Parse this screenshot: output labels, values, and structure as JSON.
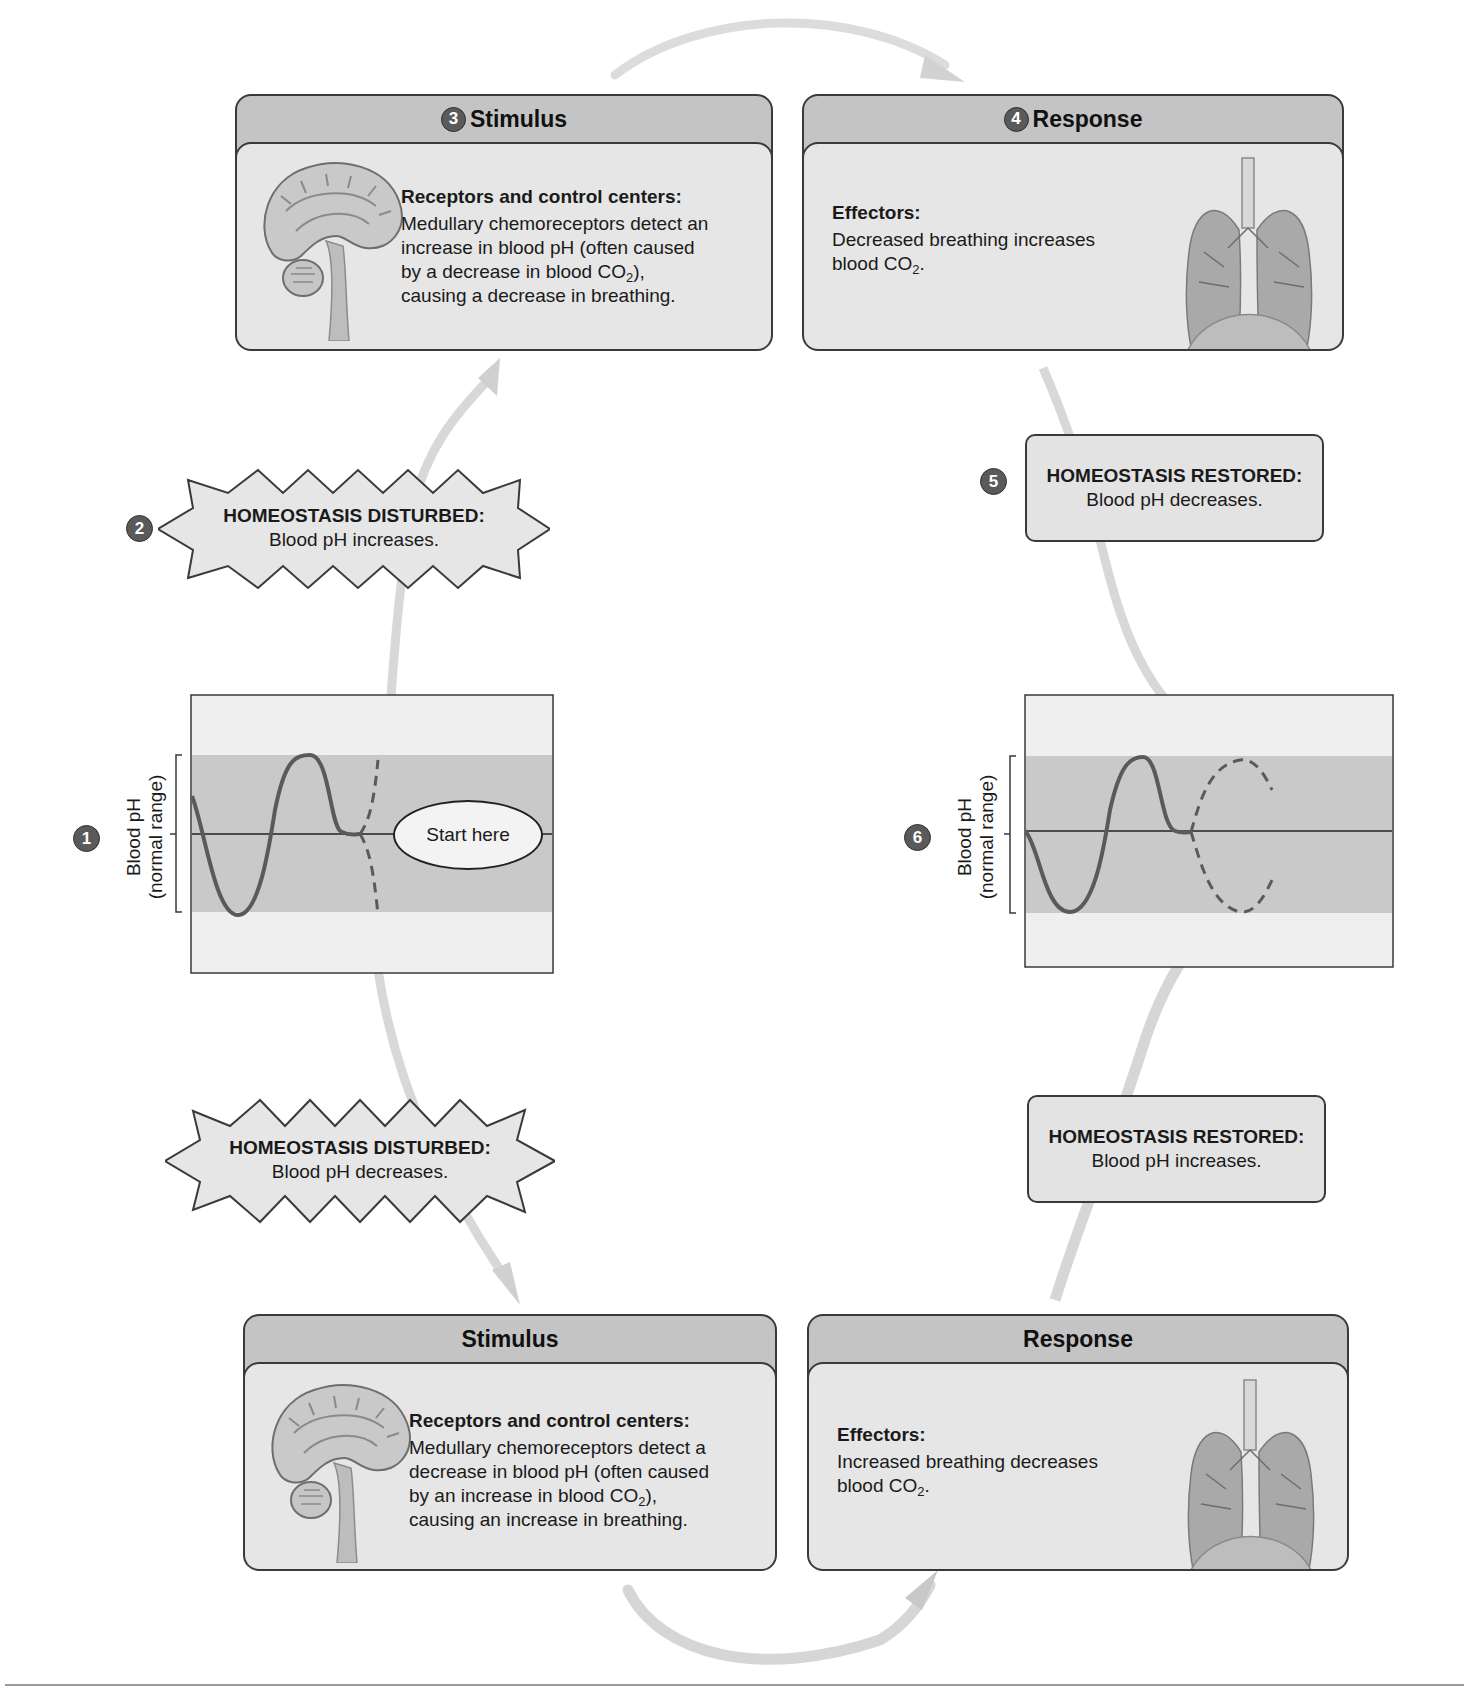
{
  "diagram": {
    "topic": "Regulation of blood pH by breathing (negative feedback)",
    "colors": {
      "panel_header": "#c4c4c4",
      "panel_body": "#e6e6e6",
      "normal_range_band": "#c8c8c8",
      "graph_bg": "#efefef",
      "curve": "#555555",
      "badge": "#5a5a5a",
      "arrow": "#d6d6d6"
    },
    "top_loop": {
      "stimulus": {
        "step": "3",
        "header": "Stimulus",
        "title": "Receptors and control centers:",
        "lines": [
          "Medullary chemoreceptors detect an",
          "increase in blood pH (often caused",
          "by a decrease in blood CO",
          "causing a decrease in breathing."
        ],
        "line3_sub": "2",
        "line3_tail": "),",
        "image": "brain-sagittal-section"
      },
      "response": {
        "step": "4",
        "header": "Response",
        "title": "Effectors:",
        "lines": [
          "Decreased breathing increases",
          "blood CO"
        ],
        "line2_sub": "2",
        "line2_tail": ".",
        "image": "lungs"
      },
      "disturbed": {
        "step": "2",
        "title": "HOMEOSTASIS DISTURBED:",
        "text": "Blood pH increases."
      },
      "restored": {
        "step": "5",
        "title": "HOMEOSTASIS RESTORED:",
        "text": "Blood pH decreases."
      }
    },
    "bottom_loop": {
      "stimulus": {
        "header": "Stimulus",
        "title": "Receptors and control centers:",
        "lines": [
          "Medullary chemoreceptors detect a",
          "decrease in blood pH (often caused",
          "by an increase in blood CO",
          "causing an increase in breathing."
        ],
        "line3_sub": "2",
        "line3_tail": "),",
        "image": "brain-sagittal-section"
      },
      "response": {
        "header": "Response",
        "title": "Effectors:",
        "lines": [
          "Increased breathing decreases",
          "blood CO"
        ],
        "line2_sub": "2",
        "line2_tail": ".",
        "image": "lungs"
      },
      "disturbed": {
        "title": "HOMEOSTASIS DISTURBED:",
        "text": "Blood pH decreases."
      },
      "restored": {
        "title": "HOMEOSTASIS RESTORED:",
        "text": "Blood pH increases."
      }
    },
    "left_graph": {
      "step": "1",
      "axis_label_line1": "Blood pH",
      "axis_label_line2": "(normal range)",
      "start_label": "Start here"
    },
    "right_graph": {
      "step": "6",
      "axis_label_line1": "Blood pH",
      "axis_label_line2": "(normal range)"
    }
  }
}
